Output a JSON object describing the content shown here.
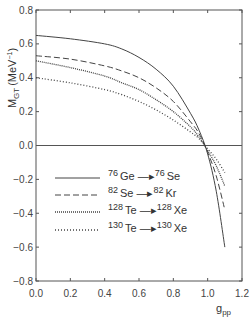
{
  "chart_data": {
    "type": "line",
    "title": "",
    "xlabel": "g_pp",
    "ylabel": "M_GT (MeV^-1)",
    "xlim": [
      0.0,
      1.2
    ],
    "ylim": [
      -0.8,
      0.8
    ],
    "xticks": [
      "0.0",
      "0.2",
      "0.4",
      "0.6",
      "0.8",
      "1.0",
      "1.2"
    ],
    "yticks": [
      "0.8",
      "0.6",
      "0.4",
      "0.2",
      "0.0",
      "-0.2",
      "-0.4",
      "-0.6",
      "-0.8"
    ],
    "grid": false,
    "reference_line": {
      "y": 0.0
    },
    "legend_position": "lower-left inside",
    "series": [
      {
        "name": "76Ge → 76Se",
        "style": "solid",
        "x": [
          0.0,
          0.2,
          0.4,
          0.5,
          0.6,
          0.7,
          0.8,
          0.9,
          0.95,
          1.0,
          1.05,
          1.1
        ],
        "y": [
          0.65,
          0.63,
          0.6,
          0.57,
          0.52,
          0.45,
          0.35,
          0.19,
          0.09,
          -0.05,
          -0.27,
          -0.6
        ]
      },
      {
        "name": "82Se → 82Kr",
        "style": "dashed",
        "x": [
          0.0,
          0.2,
          0.4,
          0.5,
          0.6,
          0.7,
          0.8,
          0.9,
          0.95,
          1.0,
          1.05,
          1.1
        ],
        "y": [
          0.53,
          0.51,
          0.47,
          0.44,
          0.4,
          0.34,
          0.26,
          0.14,
          0.07,
          -0.04,
          -0.18,
          -0.38
        ]
      },
      {
        "name": "128Te → 128Xe",
        "style": "dense-dotted",
        "x": [
          0.0,
          0.2,
          0.4,
          0.5,
          0.6,
          0.7,
          0.8,
          0.9,
          0.95,
          1.0,
          1.05,
          1.1
        ],
        "y": [
          0.5,
          0.46,
          0.41,
          0.37,
          0.33,
          0.27,
          0.2,
          0.11,
          0.05,
          -0.03,
          -0.12,
          -0.24
        ]
      },
      {
        "name": "130Te → 130Xe",
        "style": "sparse-dotted",
        "x": [
          0.0,
          0.2,
          0.4,
          0.5,
          0.6,
          0.7,
          0.8,
          0.9,
          0.95,
          1.0,
          1.05,
          1.1
        ],
        "y": [
          0.4,
          0.37,
          0.33,
          0.3,
          0.26,
          0.21,
          0.15,
          0.08,
          0.04,
          -0.02,
          -0.08,
          -0.16
        ]
      }
    ]
  },
  "axes": {
    "ylabel_main": "M",
    "ylabel_sub": "GT",
    "ylabel_unit": "(MeV",
    "ylabel_sup": "−1",
    "ylabel_close": ")",
    "xlabel_main": "g",
    "xlabel_sub": "pp"
  },
  "legend": [
    {
      "from_mass": "76",
      "from_el": "Ge",
      "to_mass": "76",
      "to_el": "Se",
      "style": "solid"
    },
    {
      "from_mass": "82",
      "from_el": "Se",
      "to_mass": "82",
      "to_el": "Kr",
      "style": "dashed"
    },
    {
      "from_mass": "128",
      "from_el": "Te",
      "to_mass": "128",
      "to_el": "Xe",
      "style": "dense-dotted"
    },
    {
      "from_mass": "130",
      "from_el": "Te",
      "to_mass": "130",
      "to_el": "Xe",
      "style": "sparse-dotted"
    }
  ],
  "colors": {
    "line": "#444444",
    "axis": "#555555",
    "background": "#ffffff"
  }
}
